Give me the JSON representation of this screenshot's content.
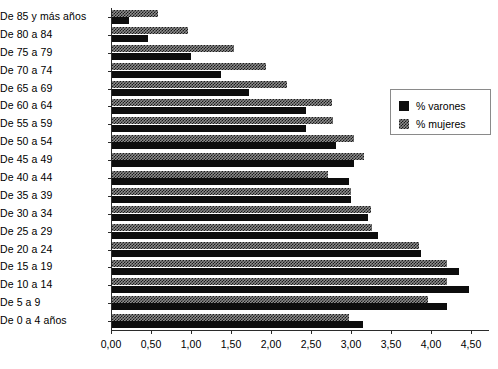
{
  "chart_data": {
    "type": "bar",
    "orientation": "horizontal",
    "title": "",
    "subtitle": "",
    "xlabel": "",
    "ylabel": "",
    "xlim": [
      0,
      4.5
    ],
    "xticks": [
      0,
      0.5,
      1,
      1.5,
      2,
      2.5,
      3,
      3.5,
      4,
      4.5
    ],
    "xtick_labels": [
      "0,00",
      "0,50",
      "1,00",
      "1,50",
      "2,00",
      "2,50",
      "3,00",
      "3,50",
      "4,00",
      "4,50"
    ],
    "grid": false,
    "legend_position": "right-upper",
    "categories": [
      "De 85 y más años",
      "De 80 a 84",
      "De 75 a 79",
      "De 70 a 74",
      "De 65 a 69",
      "De 60 a 64",
      "De 55 a 59",
      "De 50 a 54",
      "De 45 a 49",
      "De 40 a 44",
      "De 35 a 39",
      "De 30 a 34",
      "De 25 a 29",
      "De 20 a 24",
      "De 15 a 19",
      "De 10 a 14",
      "De 5 a 9",
      "De 0 a 4 años"
    ],
    "series": [
      {
        "name": "% varones",
        "color": "#0d0d0d",
        "pattern": "solid",
        "values": [
          0.21,
          0.45,
          0.99,
          1.36,
          1.71,
          2.42,
          2.43,
          2.8,
          3.03,
          2.96,
          2.99,
          3.2,
          3.33,
          3.86,
          4.34,
          4.46,
          4.19,
          3.14
        ]
      },
      {
        "name": "% mujeres",
        "color": "#8d8d8d",
        "pattern": "checkered",
        "values": [
          0.58,
          0.95,
          1.53,
          1.93,
          2.19,
          2.75,
          2.76,
          3.03,
          3.15,
          2.7,
          2.99,
          3.24,
          3.25,
          3.84,
          4.19,
          4.19,
          3.95,
          2.96
        ]
      }
    ]
  },
  "legend": {
    "entries": [
      {
        "label": "% varones",
        "swatch": "solid-black-square"
      },
      {
        "label": "% mujeres",
        "swatch": "checkered-gray-square"
      }
    ]
  },
  "colors": {
    "varones": "#0d0d0d",
    "mujeres": "#8d8d8d",
    "axis": "#2b2b2b",
    "background": "#ffffff"
  }
}
